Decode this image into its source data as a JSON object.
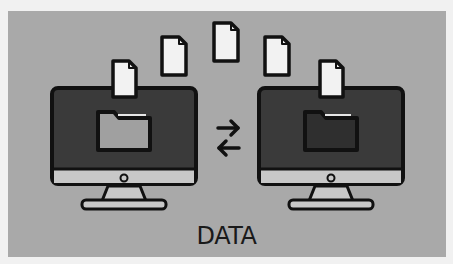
{
  "illustration": {
    "caption": "DATA",
    "colors": {
      "background": "#a9a9a9",
      "outline": "#111111",
      "screen": "#3a3a3a",
      "bezel": "#c8c8c8",
      "document": "#f2f2f2",
      "folder_source": "#a0a0a0",
      "folder_target": "#2f2f2f"
    },
    "elements": {
      "source_computer": "computer-monitor-icon",
      "target_computer": "computer-monitor-icon",
      "transfer": "exchange-arrows-icon",
      "documents_in_flight": 5
    }
  }
}
